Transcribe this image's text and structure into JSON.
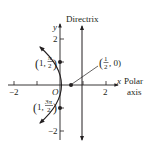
{
  "figure": {
    "type": "polar-parabola",
    "equation_note": "parabola with focus at pole, directrix x = 1",
    "colors": {
      "ink": "#231f20",
      "background": "#ffffff"
    }
  },
  "axes": {
    "x_label": "x",
    "polar_label_line1": "Polar",
    "polar_label_line2": "axis",
    "y_label": "y",
    "origin_label": "O",
    "x_ticks": [
      {
        "value": -2,
        "label": "−2"
      },
      {
        "value": -1,
        "label": ""
      },
      {
        "value": 1,
        "label": ""
      },
      {
        "value": 2,
        "label": "2"
      }
    ],
    "y_ticks": [
      {
        "value": 2,
        "label": "2"
      },
      {
        "value": 1,
        "label": ""
      },
      {
        "value": -1,
        "label": ""
      },
      {
        "value": -2,
        "label": "−2"
      }
    ]
  },
  "directrix": {
    "label": "Directrix",
    "x": 1
  },
  "points": [
    {
      "id": "vertex",
      "label_num": "1",
      "label_den": "2",
      "label_tail": ", 0)",
      "x": 0.5,
      "y": 0
    },
    {
      "id": "top",
      "label_prefix": "(1, ",
      "label_num": "π",
      "label_den": "2",
      "label_tail": ")",
      "x": 0,
      "y": 1
    },
    {
      "id": "bottom",
      "label_prefix": "(1, ",
      "label_num": "3π",
      "label_den": "2",
      "label_tail": ")",
      "x": 0,
      "y": -1
    }
  ]
}
